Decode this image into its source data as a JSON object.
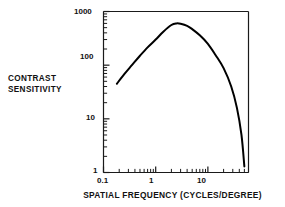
{
  "figure": {
    "name": "contrast-sensitivity-function",
    "background_color": "#ffffff",
    "line_color": "#000000",
    "axis_color": "#1a1a1a"
  },
  "labels": {
    "ylabel_line1": "CONTRAST",
    "ylabel_line2": "SENSITIVITY",
    "xlabel": "SPATIAL FREQUENCY (CYCLES/DEGREE)"
  },
  "ticks": {
    "y": [
      "1",
      "10",
      "100",
      "1000"
    ],
    "x": [
      "0.1",
      "1",
      "10"
    ]
  },
  "chart_data": {
    "type": "line",
    "title": "",
    "subtitle": "",
    "xlabel": "SPATIAL FREQUENCY (CYCLES/DEGREE)",
    "ylabel": "CONTRAST SENSITIVITY",
    "xscale": "log",
    "yscale": "log",
    "xlim": [
      0.1,
      60
    ],
    "ylim": [
      1,
      1000
    ],
    "xticks": [
      0.1,
      1,
      10
    ],
    "xticklabels": [
      "0.1",
      "1",
      "10"
    ],
    "yticks": [
      1,
      10,
      100,
      1000
    ],
    "yticklabels": [
      "1",
      "10",
      "100",
      "1000"
    ],
    "minor_ticks": true,
    "grid": false,
    "legend": null,
    "legend_position": "none",
    "annotations": [],
    "series": [
      {
        "name": "contrast sensitivity function",
        "line_color": "#000000",
        "line_width": 2,
        "x": [
          0.18,
          0.25,
          0.35,
          0.5,
          0.7,
          1.0,
          1.4,
          2.0,
          2.5,
          3.0,
          4.0,
          5.0,
          7.0,
          10.0,
          14.0,
          20.0,
          28.0,
          36.0,
          44.0,
          50.0
        ],
        "y": [
          45,
          68,
          100,
          150,
          215,
          300,
          420,
          560,
          600,
          590,
          540,
          470,
          360,
          250,
          155,
          88,
          40,
          16,
          5,
          1.3
        ]
      }
    ],
    "peak": {
      "x": 2.5,
      "y": 600
    }
  }
}
